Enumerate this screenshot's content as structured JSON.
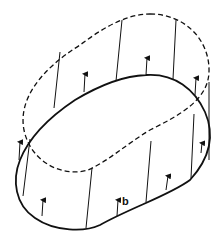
{
  "figure": {
    "vector_label": "b",
    "colors": {
      "stroke": "#111111",
      "background": "#ffffff"
    },
    "elements": {
      "solid_loop": "original-curve",
      "dashed_loop": "displaced-curve",
      "connecting_lines": 8,
      "field_arrows": 9
    }
  }
}
